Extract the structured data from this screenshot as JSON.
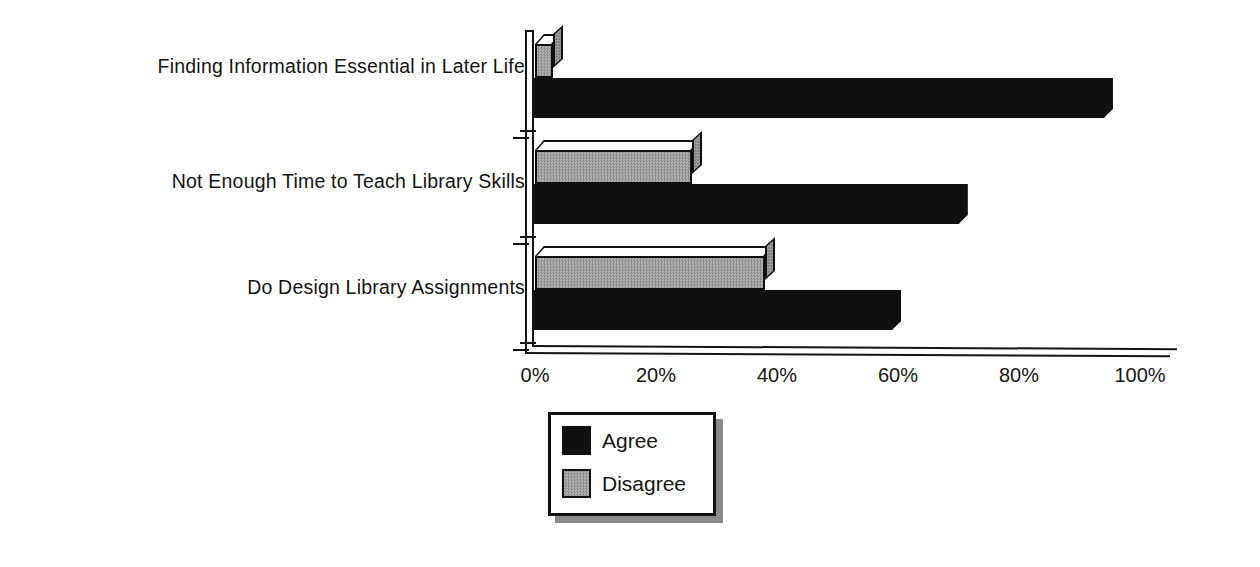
{
  "chart_data": {
    "type": "bar",
    "orientation": "horizontal",
    "title": "",
    "xlabel": "",
    "ylabel": "",
    "xlim": [
      0,
      100
    ],
    "xticks": [
      "0%",
      "20%",
      "40%",
      "60%",
      "80%",
      "100%"
    ],
    "xtick_values": [
      0,
      20,
      40,
      60,
      80,
      100
    ],
    "grid": false,
    "legend_position": "bottom-left",
    "categories": [
      "Finding Information Essential in Later Life",
      "Not Enough Time to Teach Library Skills",
      "Do Design Library Assignments"
    ],
    "series": [
      {
        "name": "Agree",
        "color": "#111111",
        "values": [
          96,
          72,
          61
        ]
      },
      {
        "name": "Disagree",
        "color": "#a0a0a0",
        "values": [
          3,
          26,
          38
        ]
      }
    ]
  },
  "legend": {
    "items": [
      {
        "label": "Agree",
        "swatch": "agree"
      },
      {
        "label": "Disagree",
        "swatch": "disagree"
      }
    ]
  }
}
